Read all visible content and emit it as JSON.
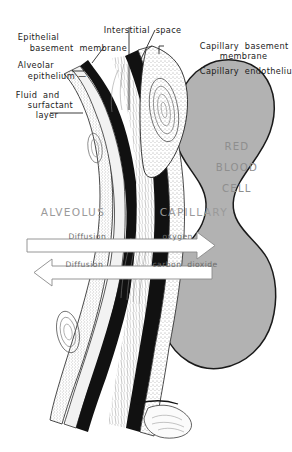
{
  "diagram": {
    "colors": {
      "rbc_fill": "#b2b2b2",
      "rbc_stroke": "#1a1a1a",
      "basement_membrane": "#111111",
      "region_text": "#9a9a9a",
      "flow_text": "#6d6d6d",
      "label_text": "#1a1a1a",
      "background": "#ffffff"
    },
    "labels": [
      {
        "id": "epithelial-basement-membrane",
        "line1": "Epithelial",
        "line2": "basement  membrane"
      },
      {
        "id": "alveolar-epithelium",
        "line1": "Alveolar",
        "line2": "epithelium"
      },
      {
        "id": "fluid-and-surfactant-layer",
        "line1": "Fluid  and",
        "line2": "surfactant",
        "line3": "layer"
      },
      {
        "id": "interstitial-space",
        "line1": "Interstitial  space"
      },
      {
        "id": "capillary-basement-membrane",
        "line1": "Capillary  basement",
        "line2": "membrane"
      },
      {
        "id": "capillary-endothelium",
        "line1": "Capillary  endothelium"
      }
    ],
    "regions": [
      {
        "id": "alveolus",
        "label": "ALVEOLUS"
      },
      {
        "id": "capillary",
        "label": "CAPILLARY"
      }
    ],
    "red_blood_cell": {
      "id": "red-blood-cell",
      "line1": "RED",
      "line2": "BLOOD",
      "line3": "CELL"
    },
    "flows": [
      {
        "id": "oxygen-diffusion",
        "process": "Diffusion",
        "substance": "oxygen",
        "direction": "right"
      },
      {
        "id": "carbon-dioxide-diffusion",
        "process": "Diffusion",
        "substance": "carbon  dioxide",
        "direction": "left"
      }
    ]
  }
}
